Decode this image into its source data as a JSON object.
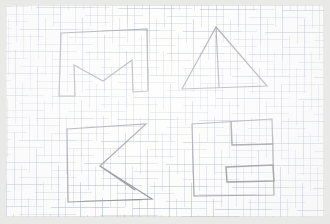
{
  "image": {
    "subject": "hand-drawn block letters on graph paper",
    "word": "MAKE",
    "media": "pencil on grid paper, photographed",
    "width": 330,
    "height": 224,
    "colors": {
      "paper": "#fdfdfc",
      "photo_margin": "#e9e9e7",
      "grid_line": "#96a0b9",
      "pencil": "#7b7b84",
      "pencil_dark": "#6a6a73"
    }
  },
  "letters": [
    {
      "id": "letter-m",
      "label": "M",
      "position": "top-left",
      "description": "outlined block letter M, open-bottom, drawn with straight ruled strokes",
      "path": "M 55 28 L 141 24 L 142 86 L 127 87 L 126 55 L 97 76 L 68 60 L 69 91 L 53 91 Z"
    },
    {
      "id": "letter-a",
      "label": "A",
      "position": "top-right",
      "description": "triangle with a vertical crossbar from apex to base forming a block letter A",
      "path": "M 210 22 L 261 81 L 176 84 Z",
      "path_inner": "M 210 22 L 213 82"
    },
    {
      "id": "letter-k",
      "label": "K",
      "position": "bottom-left",
      "description": "outlined block letter K built from an upright stem and two diagonals",
      "path": "M 61 124 L 140 119 L 94 161 L 146 194 L 62 197 Z",
      "path_inner": "M 94 161 L 129 185"
    },
    {
      "id": "letter-e",
      "label": "E",
      "position": "bottom-right",
      "description": "outlined block letter E with two inset notches cut from the right side",
      "path": "M 186 119 L 266 114 L 268 190 L 188 191 Z",
      "path_inner_top": "M 225 117 L 226 140 L 267 139",
      "path_inner_bottom": "M 220 162 L 267 160 L 268 176 L 221 177 Z"
    }
  ]
}
